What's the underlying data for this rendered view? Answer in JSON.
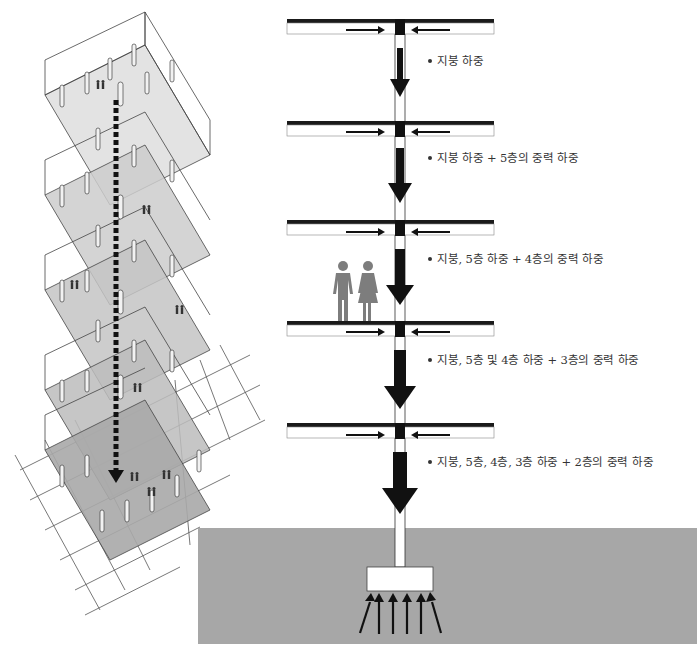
{
  "diagram": {
    "type": "structural-gravity-load-path",
    "colors": {
      "ground": "#a7a7a7",
      "slab_fill": "#bdbdbd",
      "beam": "#1a1a1a",
      "arrow": "#111111",
      "people": "#7d7d7d",
      "text": "#333333"
    },
    "floors": [
      {
        "id": "roof",
        "label": "지붕 하중"
      },
      {
        "id": "5F",
        "label": "지붕 하중 + 5층의 중력 하중"
      },
      {
        "id": "4F",
        "label": "지붕, 5층 하중 + 4층의 중력 하중"
      },
      {
        "id": "3F",
        "label": "지붕, 5층 및 4층 하중 + 3층의 중력 하중"
      },
      {
        "id": "2F",
        "label": "지붕, 5층, 4층, 3층 하중 + 2층의 중력 하중"
      }
    ],
    "foundation": {
      "label": "",
      "reaction_arrow_count": 6
    },
    "people_figures": [
      "man-figure",
      "woman-figure"
    ],
    "isometric_building": {
      "levels": 5,
      "load_path": "dashed-arrow-down"
    }
  }
}
